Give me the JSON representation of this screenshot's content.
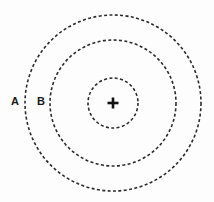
{
  "diagram": {
    "background_color": "#fdfdfd",
    "stroke_color": "#2b2b2b",
    "center_color": "#111111",
    "center": {
      "x": 113,
      "y": 103,
      "marker": "plus-cross-icon"
    },
    "rings": [
      {
        "id": "inner",
        "radius": 25,
        "style": "dashed"
      },
      {
        "id": "middle",
        "radius": 63,
        "style": "dashed"
      },
      {
        "id": "outer",
        "radius": 88,
        "style": "dashed"
      }
    ],
    "labels": [
      {
        "id": "a",
        "text": "A",
        "x": 11,
        "y": 96
      },
      {
        "id": "b",
        "text": "B",
        "x": 37,
        "y": 96
      }
    ]
  }
}
